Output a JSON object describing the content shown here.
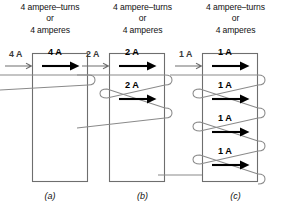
{
  "figure": {
    "type": "electrical-schematic",
    "shared_caption": {
      "line1": "4 ampere–turns",
      "line2": "or",
      "line3": "4 amperes"
    },
    "colors": {
      "core_stroke": "#6e6e6e",
      "wire_stroke": "#8a8a8a",
      "arrow": "#000000",
      "background": "#ffffff",
      "text": "#111111"
    },
    "panels": [
      {
        "id": "a",
        "label": "(a)",
        "turns": 4,
        "turn_count_drawn": 1,
        "current_amperes": 4,
        "current_text": "4 A",
        "lead_label": "4 A",
        "caption": {
          "line1": "4 ampere–turns",
          "line2": "or",
          "line3": "4 amperes"
        },
        "turn_labels": [
          "4 A"
        ]
      },
      {
        "id": "b",
        "label": "(b)",
        "turns": 2,
        "turn_count_drawn": 2,
        "current_amperes": 2,
        "current_text": "2 A",
        "lead_label": "2 A",
        "caption": {
          "line1": "4 ampere–turns",
          "line2": "or",
          "line3": "4 amperes"
        },
        "turn_labels": [
          "2 A",
          "2 A"
        ]
      },
      {
        "id": "c",
        "label": "(c)",
        "turns": 4,
        "turn_count_drawn": 4,
        "current_amperes": 1,
        "current_text": "1 A",
        "lead_label": "1 A",
        "caption": {
          "line1": "4 ampere–turns",
          "line2": "or",
          "line3": "4 amperes"
        },
        "turn_labels": [
          "1 A",
          "1 A",
          "1 A",
          "1 A"
        ]
      }
    ]
  }
}
